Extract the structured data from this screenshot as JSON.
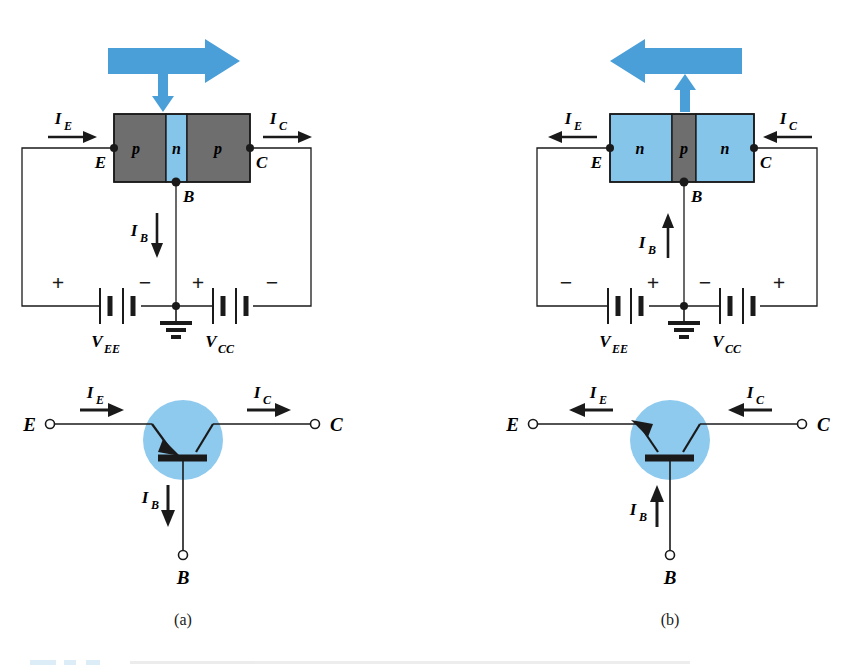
{
  "figure": {
    "type": "transistor-bias-diagram",
    "background": "#ffffff",
    "colors": {
      "blue_fill": "#86c5ea",
      "blue_arrow": "#4a9fd8",
      "gray_fill": "#6e6e6e",
      "line": "#1a1a1a",
      "symbol_circle": "#8ec9ee"
    },
    "panels": [
      {
        "id": "a",
        "caption": "(a)",
        "device": "pnp",
        "blocks": [
          {
            "label": "p",
            "material": "p",
            "fill": "gray"
          },
          {
            "label": "n",
            "material": "n",
            "fill": "blue"
          },
          {
            "label": "p",
            "material": "p",
            "fill": "gray"
          }
        ],
        "terminals": {
          "emitter": "E",
          "base": "B",
          "collector": "C"
        },
        "currents": [
          {
            "name": "I_E",
            "base": "I",
            "sub": "E",
            "direction": "right"
          },
          {
            "name": "I_C",
            "base": "I",
            "sub": "C",
            "direction": "right"
          },
          {
            "name": "I_B",
            "base": "I",
            "sub": "B",
            "direction": "down"
          }
        ],
        "sources": [
          {
            "name": "V_EE",
            "base": "V",
            "sub": "EE",
            "left_polarity": "+",
            "right_polarity": "−"
          },
          {
            "name": "V_CC",
            "base": "V",
            "sub": "CC",
            "left_polarity": "+",
            "right_polarity": "−"
          }
        ],
        "majority_carrier_arrow": {
          "direction": "right",
          "branch": "down"
        },
        "ground": true,
        "symbol": {
          "type": "pnp",
          "emitter_arrow": "into-base",
          "emitter_label": "E",
          "base_label": "B",
          "collector_label": "C",
          "current_directions": {
            "I_E": "right",
            "I_C": "right",
            "I_B": "down"
          }
        }
      },
      {
        "id": "b",
        "caption": "(b)",
        "device": "npn",
        "blocks": [
          {
            "label": "n",
            "material": "n",
            "fill": "blue"
          },
          {
            "label": "p",
            "material": "p",
            "fill": "gray"
          },
          {
            "label": "n",
            "material": "n",
            "fill": "blue"
          }
        ],
        "terminals": {
          "emitter": "E",
          "base": "B",
          "collector": "C"
        },
        "currents": [
          {
            "name": "I_E",
            "base": "I",
            "sub": "E",
            "direction": "left"
          },
          {
            "name": "I_C",
            "base": "I",
            "sub": "C",
            "direction": "left"
          },
          {
            "name": "I_B",
            "base": "I",
            "sub": "B",
            "direction": "up"
          }
        ],
        "sources": [
          {
            "name": "V_EE",
            "base": "V",
            "sub": "EE",
            "left_polarity": "−",
            "right_polarity": "+"
          },
          {
            "name": "V_CC",
            "base": "V",
            "sub": "CC",
            "left_polarity": "−",
            "right_polarity": "+"
          }
        ],
        "majority_carrier_arrow": {
          "direction": "left",
          "branch": "up"
        },
        "ground": true,
        "symbol": {
          "type": "npn",
          "emitter_arrow": "out-of-base",
          "emitter_label": "E",
          "base_label": "B",
          "collector_label": "C",
          "current_directions": {
            "I_E": "left",
            "I_C": "left",
            "I_B": "up"
          }
        }
      }
    ],
    "panel_a": {
      "caption": "(a)",
      "block_left": "p",
      "block_mid": "n",
      "block_right": "p",
      "E": "E",
      "B": "B",
      "C": "C",
      "I": "I",
      "sub_E": "E",
      "sub_C": "C",
      "sub_B": "B",
      "V": "V",
      "sub_EE": "EE",
      "sub_CC": "CC",
      "pol_ee_left": "+",
      "pol_ee_right": "−",
      "pol_cc_left": "+",
      "pol_cc_right": "−"
    },
    "panel_b": {
      "caption": "(b)",
      "block_left": "n",
      "block_mid": "p",
      "block_right": "n",
      "E": "E",
      "B": "B",
      "C": "C",
      "I": "I",
      "sub_E": "E",
      "sub_C": "C",
      "sub_B": "B",
      "V": "V",
      "sub_EE": "EE",
      "sub_CC": "CC",
      "pol_ee_left": "−",
      "pol_ee_right": "+",
      "pol_cc_left": "−",
      "pol_cc_right": "+"
    },
    "symbol_a": {
      "E": "E",
      "B": "B",
      "C": "C",
      "I": "I",
      "sub_E": "E",
      "sub_C": "C",
      "sub_B": "B"
    },
    "symbol_b": {
      "E": "E",
      "B": "B",
      "C": "C",
      "I": "I",
      "sub_E": "E",
      "sub_C": "C",
      "sub_B": "B"
    }
  }
}
